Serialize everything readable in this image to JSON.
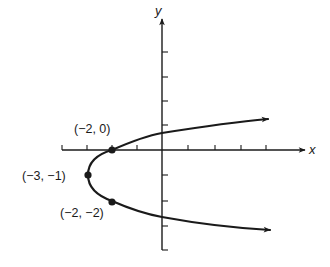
{
  "figure": {
    "axes": {
      "x_label": "x",
      "y_label": "y",
      "x_ticks": [
        -4,
        -3,
        -2,
        -1,
        1,
        2,
        3,
        4
      ],
      "y_ticks": [
        4,
        3,
        2,
        1,
        -1,
        -2,
        -3,
        -4
      ]
    },
    "curve": {
      "type": "parabola opening right",
      "equation_implied": "x = (y + 1)^2 - 3"
    },
    "points": [
      {
        "label": "(−2, 0)",
        "x": -2,
        "y": 0
      },
      {
        "label": "(−3, −1)",
        "x": -3,
        "y": -1
      },
      {
        "label": "(−2, −2)",
        "x": -2,
        "y": -2
      }
    ],
    "colors": {
      "ink": "#1a1a1a",
      "background": "#ffffff"
    }
  }
}
